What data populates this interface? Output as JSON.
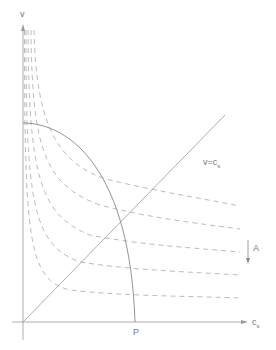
{
  "diagram": {
    "axes": {
      "x_label": "c",
      "x_label_sub": "s",
      "y_label": "v"
    },
    "line_label": "v=c",
    "line_label_sub": "s",
    "point_label": "P",
    "arrow_label": "A",
    "colors": {
      "axis": "#999999",
      "curve": "#888888",
      "dashed": "#aaaaaa",
      "text": "#777777"
    },
    "dashed_curve_count": 5,
    "dashed_curve_right_y": [
      206,
      229,
      252,
      275,
      298
    ]
  }
}
